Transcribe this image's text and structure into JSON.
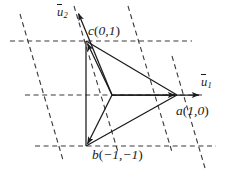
{
  "figure": {
    "background_color": "#ffffff",
    "line_color": "#1a1a1a",
    "dash_color": "#3a3a3a"
  },
  "axes": {
    "u1": {
      "symbol": "u",
      "subscript": "1",
      "tip": [
        200,
        95
      ]
    },
    "u2": {
      "symbol": "u",
      "subscript": "2",
      "tip": [
        78,
        12
      ]
    }
  },
  "points": [
    {
      "id": "a",
      "name": "a",
      "coords": "(1,0)",
      "x": 177,
      "y": 95
    },
    {
      "id": "b",
      "name": "b",
      "coords": "(−1,−1)",
      "x": 86,
      "y": 146
    },
    {
      "id": "c",
      "name": "c",
      "coords": "(0,1)",
      "x": 86,
      "y": 41
    }
  ],
  "labels": {
    "u1": "u",
    "u1_sub": "1",
    "u2": "u",
    "u2_sub": "2",
    "a_name": "a",
    "a_open": "(",
    "a_coords": "1,0",
    "a_close": ")",
    "b_name": "b",
    "b_open": "(",
    "b_coords": "−1,−1",
    "b_close": ")",
    "c_name": "c",
    "c_open": "(",
    "c_coords": "0,1",
    "c_close": ")"
  },
  "origin": {
    "x": 112,
    "y": 95
  },
  "grid": {
    "horizontal_lines": [
      {
        "y": 41,
        "x1": 10,
        "x2": 192
      },
      {
        "y": 95,
        "x1": 25,
        "x2": 205
      },
      {
        "y": 146,
        "x1": 35,
        "x2": 216
      }
    ],
    "slanted_lines": [
      {
        "x1": 20,
        "y1": 14,
        "x2": 63,
        "y2": 160
      },
      {
        "x1": 74,
        "y1": 6,
        "x2": 118,
        "y2": 152
      },
      {
        "x1": 128,
        "y1": 6,
        "x2": 172,
        "y2": 152
      },
      {
        "x1": 172,
        "y1": 56,
        "x2": 205,
        "y2": 168
      }
    ]
  }
}
